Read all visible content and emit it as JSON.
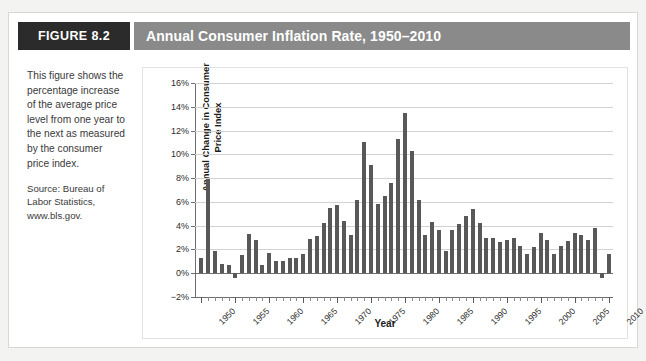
{
  "figure": {
    "badge": "FIGURE 8.2",
    "title": "Annual Consumer Inflation Rate, 1950–2010"
  },
  "caption": {
    "body": "This figure shows the percentage increase of the average price level from one year to the next as measured by the consumer price index.",
    "source": "Source: Bureau of Labor Statistics, www.bls.gov."
  },
  "colors": {
    "badge_background": "#2b2b2b",
    "title_background": "#8a8a8a",
    "bar": "#585858",
    "gridline": "#d2d2d2",
    "axis": "#6e6e6e",
    "page_background": "#f3f3f2",
    "card_background": "#ffffff"
  },
  "chart_data": {
    "type": "bar",
    "title": "Annual Consumer Inflation Rate, 1950–2010",
    "xlabel": "Year",
    "ylabel": "Annual Change in Consumer Price Index",
    "ylim": [
      -2,
      16
    ],
    "ytick_values": [
      -2,
      0,
      2,
      4,
      6,
      8,
      10,
      12,
      14,
      16
    ],
    "ytick_labels": [
      "−2%",
      "0%",
      "2%",
      "4%",
      "6%",
      "8%",
      "10%",
      "12%",
      "14%",
      "16%"
    ],
    "xlim": [
      1950,
      2010
    ],
    "xtick_labels": [
      "1950",
      "1955",
      "1960",
      "1965",
      "1970",
      "1975",
      "1980",
      "1985",
      "1990",
      "1995",
      "2000",
      "2005",
      "2010"
    ],
    "xtick_values": [
      1950,
      1955,
      1960,
      1965,
      1970,
      1975,
      1980,
      1985,
      1990,
      1995,
      2000,
      2005,
      2010
    ],
    "xtick_interval_minor": 1,
    "grid": "horizontal",
    "legend": "none",
    "series_name": "Annual Change in Consumer Price Index",
    "categories": [
      1950,
      1951,
      1952,
      1953,
      1954,
      1955,
      1956,
      1957,
      1958,
      1959,
      1960,
      1961,
      1962,
      1963,
      1964,
      1965,
      1966,
      1967,
      1968,
      1969,
      1970,
      1971,
      1972,
      1973,
      1974,
      1975,
      1976,
      1977,
      1978,
      1979,
      1980,
      1981,
      1982,
      1983,
      1984,
      1985,
      1986,
      1987,
      1988,
      1989,
      1990,
      1991,
      1992,
      1993,
      1994,
      1995,
      1996,
      1997,
      1998,
      1999,
      2000,
      2001,
      2002,
      2003,
      2004,
      2005,
      2006,
      2007,
      2008,
      2009,
      2010
    ],
    "values": [
      1.3,
      7.9,
      1.9,
      0.8,
      0.7,
      -0.4,
      1.5,
      3.3,
      2.8,
      0.7,
      1.7,
      1.0,
      1.0,
      1.3,
      1.3,
      1.6,
      2.9,
      3.1,
      4.2,
      5.5,
      5.7,
      4.4,
      3.2,
      6.2,
      11.0,
      9.1,
      5.8,
      6.5,
      7.6,
      11.3,
      13.5,
      10.3,
      6.2,
      3.2,
      4.3,
      3.6,
      1.9,
      3.6,
      4.1,
      4.8,
      5.4,
      4.2,
      3.0,
      3.0,
      2.6,
      2.8,
      3.0,
      2.3,
      1.6,
      2.2,
      3.4,
      2.8,
      1.6,
      2.3,
      2.7,
      3.4,
      3.2,
      2.8,
      3.8,
      -0.4,
      1.6
    ]
  }
}
